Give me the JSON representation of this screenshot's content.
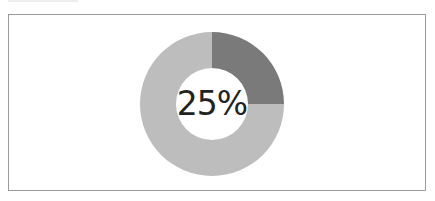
{
  "chart_data": {
    "type": "pie",
    "subtype": "donut",
    "title": "",
    "categories": [
      "Filled",
      "Remaining"
    ],
    "values": [
      25,
      75
    ],
    "colors": [
      "#7a7a7a",
      "#bdbdbd"
    ],
    "center_label": "25%",
    "legend": "none"
  }
}
